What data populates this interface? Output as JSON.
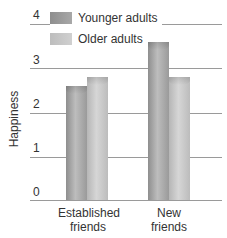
{
  "chart_data": {
    "type": "bar",
    "title": "",
    "xlabel": "",
    "ylabel": "Happiness",
    "ylim": [
      0,
      4
    ],
    "yticks": [
      "0",
      "1",
      "2",
      "3",
      "4"
    ],
    "categories": [
      "Established friends",
      "New friends"
    ],
    "category_lines": [
      [
        "Established",
        "friends"
      ],
      [
        "New",
        "friends"
      ]
    ],
    "series": [
      {
        "name": "Younger adults",
        "values": [
          2.6,
          3.6
        ],
        "color": "#a3a3a3"
      },
      {
        "name": "Older adults",
        "values": [
          2.8,
          2.8
        ],
        "color": "#c9c9c9"
      }
    ],
    "grid": true,
    "legend_position": "top-left"
  }
}
